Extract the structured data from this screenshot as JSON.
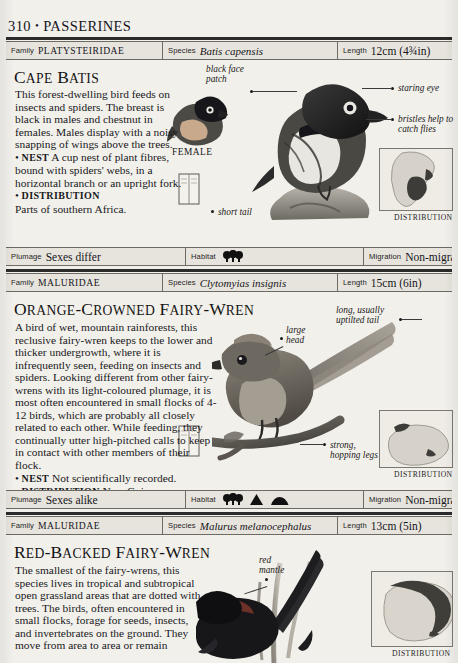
{
  "page": {
    "number": "310",
    "separator": "•",
    "section": "PASSERINES"
  },
  "labels": {
    "family": "Family",
    "species": "Species",
    "length": "Length",
    "plumage": "Plumage",
    "habitat": "Habitat",
    "migration": "Migration",
    "distribution_caption": "DISTRIBUTION"
  },
  "entries": [
    {
      "family": "PLATYSTEIRIDAE",
      "species_latin": "Batis capensis",
      "length": "12cm (4¾in)",
      "common_name_first": "C",
      "common_name": "Cape Batis",
      "description": "This forest-dwelling bird feeds on insects and spiders. The breast is black in males and chestnut in females. Males display with a noisy snapping of wings above the trees.",
      "nest_keyword": "Nest",
      "nest": "A cup nest of plant fibres, bound with spiders' webs, in a horizontal branch or an upright fork.",
      "distribution_keyword": "Distribution",
      "distribution": "Parts of southern Africa.",
      "plumage": "Sexes differ",
      "habitat_icons": [
        "forest"
      ],
      "migration": "Non-migrant",
      "figure_label": "FEMALE",
      "annotations": [
        {
          "text": "black face patch",
          "align": "left"
        },
        {
          "text": "staring eye",
          "align": "left"
        },
        {
          "text": "bristles help to catch flies",
          "align": "left"
        },
        {
          "text": "short tail",
          "align": "left"
        }
      ]
    },
    {
      "family": "MALURIDAE",
      "species_latin": "Clytomyias insignis",
      "length": "15cm (6in)",
      "common_name": "Orange-crowned Fairy-Wren",
      "description": "A bird of wet, mountain rainforests, this reclusive fairy-wren keeps to the lower and thicker undergrowth, where it is infrequently seen, feeding on insects and spiders. Looking different from other fairy-wrens with its light-coloured plumage, it is most often encountered in small flocks of 4-12 birds, which are probably all closely related to each other. While feeding, they continually utter high-pitched calls to keep in contact with other members of their flock.",
      "nest_keyword": "Nest",
      "nest": "Not scientifically recorded.",
      "distribution_keyword": "Distribution",
      "distribution": "New Guinea.",
      "plumage": "Sexes alike",
      "habitat_icons": [
        "forest",
        "mountain",
        "hill"
      ],
      "migration": "Non-migrant",
      "annotations": [
        {
          "text": "long, usually uptilted tail",
          "align": "right"
        },
        {
          "text": "large head",
          "align": "left"
        },
        {
          "text": "strong, hopping legs",
          "align": "left"
        }
      ]
    },
    {
      "family": "MALURIDAE",
      "species_latin": "Malurus melanocephalus",
      "length": "13cm (5in)",
      "common_name": "Red-backed Fairy-Wren",
      "description": "The smallest of the fairy-wrens, this species lives in tropical and subtropical open grassland areas that are dotted with trees. The birds, often encountered in small flocks, forage for seeds, insects, and invertebrates on the ground. They move from area to area or remain",
      "annotations": [
        {
          "text": "red mantle",
          "align": "left"
        }
      ]
    }
  ]
}
